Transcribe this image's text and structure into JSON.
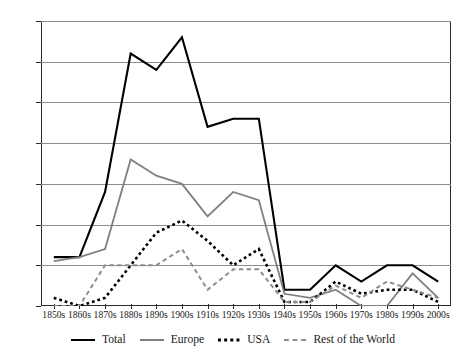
{
  "chart_data": {
    "type": "line",
    "title": "",
    "xlabel": "",
    "ylabel": "",
    "ylim": [
      0,
      35
    ],
    "yticks": [
      0,
      5,
      10,
      15,
      20,
      25,
      30,
      35
    ],
    "grid": true,
    "legend_position": "bottom",
    "categories": [
      "1850s",
      "1860s",
      "1870s",
      "1880s",
      "1890s",
      "1900s",
      "1910s",
      "1920s",
      "1930s",
      "1940s",
      "1950s",
      "1960s",
      "1970s",
      "1980s",
      "1990s",
      "2000s"
    ],
    "series": [
      {
        "name": "Total",
        "color": "#000000",
        "style": "solid",
        "values": [
          6,
          6,
          14,
          31,
          29,
          33,
          22,
          23,
          23,
          2,
          2,
          5,
          3,
          5,
          5,
          3
        ]
      },
      {
        "name": "Europe",
        "color": "#808080",
        "style": "solid",
        "values": [
          5.5,
          6,
          7,
          18,
          16,
          15,
          11,
          14,
          13,
          1.5,
          1,
          2,
          0,
          0,
          4,
          1
        ]
      },
      {
        "name": "USA",
        "color": "#000000",
        "style": "dotted",
        "values": [
          1,
          0,
          1,
          5,
          9,
          10.5,
          8,
          5,
          7,
          0.5,
          0.5,
          3,
          1.5,
          2,
          2,
          0.5
        ]
      },
      {
        "name": "Rest of the World",
        "color": "#8c8c8c",
        "style": "dashed",
        "values": [
          0,
          0,
          5,
          5,
          5,
          7,
          2,
          4.5,
          4.5,
          0.5,
          0.5,
          2.5,
          1,
          3,
          2,
          1
        ]
      }
    ]
  },
  "legend": {
    "items": [
      {
        "label": "Total",
        "swatch": "solid-black-line"
      },
      {
        "label": "Europe",
        "swatch": "solid-gray-line"
      },
      {
        "label": "USA",
        "swatch": "dotted-black-line"
      },
      {
        "label": "Rest of the World",
        "swatch": "dashed-gray-line"
      }
    ]
  }
}
